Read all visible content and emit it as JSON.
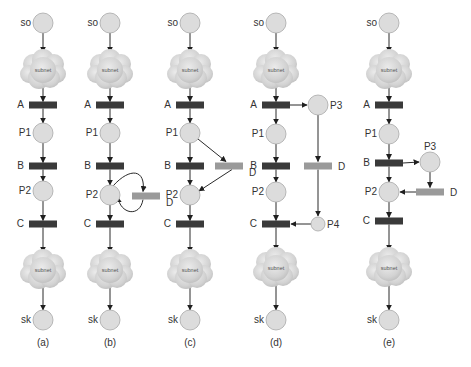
{
  "figure": {
    "colors": {
      "place_fill": "#dcdcdc",
      "place_stroke": "#a8a8a8",
      "transition_dark": "#3a3a3a",
      "transition_light": "#9a9a9a",
      "cloud": "#d0d0d0",
      "arc": "#2a2a2a"
    },
    "panels": [
      {
        "id": "a",
        "caption": "(a)",
        "x": 43,
        "nodes": [
          {
            "id": "so",
            "type": "place",
            "label": "so",
            "y": 23
          },
          {
            "id": "subnet1",
            "type": "cloud",
            "label": "subnet",
            "y": 70
          },
          {
            "id": "A",
            "type": "transition",
            "label": "A",
            "y": 105
          },
          {
            "id": "P1",
            "type": "place",
            "label": "P1",
            "y": 133
          },
          {
            "id": "B",
            "type": "transition",
            "label": "B",
            "y": 166
          },
          {
            "id": "P2",
            "type": "place",
            "label": "P2",
            "y": 191
          },
          {
            "id": "C",
            "type": "transition",
            "label": "C",
            "y": 224
          },
          {
            "id": "subnet2",
            "type": "cloud",
            "label": "subnet",
            "y": 270
          },
          {
            "id": "sk",
            "type": "place",
            "label": "sk",
            "y": 320
          }
        ],
        "extra": []
      },
      {
        "id": "b",
        "caption": "(b)",
        "x": 110,
        "nodes": [
          {
            "id": "so",
            "type": "place",
            "label": "so",
            "y": 23
          },
          {
            "id": "subnet1",
            "type": "cloud",
            "label": "subnet",
            "y": 70
          },
          {
            "id": "A",
            "type": "transition",
            "label": "A",
            "y": 105
          },
          {
            "id": "P1",
            "type": "place",
            "label": "P1",
            "y": 133
          },
          {
            "id": "B",
            "type": "transition",
            "label": "B",
            "y": 166
          },
          {
            "id": "P2",
            "type": "place",
            "label": "P2",
            "y": 195
          },
          {
            "id": "C",
            "type": "transition",
            "label": "C",
            "y": 224
          },
          {
            "id": "subnet2",
            "type": "cloud",
            "label": "subnet",
            "y": 270
          },
          {
            "id": "sk",
            "type": "place",
            "label": "sk",
            "y": 320
          }
        ],
        "extra": [
          {
            "id": "D",
            "type": "transition-light",
            "label": "D",
            "x": 146,
            "y": 196
          }
        ]
      },
      {
        "id": "c",
        "caption": "(c)",
        "x": 190,
        "nodes": [
          {
            "id": "so",
            "type": "place",
            "label": "so",
            "y": 23
          },
          {
            "id": "subnet1",
            "type": "cloud",
            "label": "subnet",
            "y": 70
          },
          {
            "id": "A",
            "type": "transition",
            "label": "A",
            "y": 105
          },
          {
            "id": "P1",
            "type": "place",
            "label": "P1",
            "y": 133
          },
          {
            "id": "B",
            "type": "transition",
            "label": "B",
            "y": 166
          },
          {
            "id": "P2",
            "type": "place",
            "label": "P2",
            "y": 195
          },
          {
            "id": "C",
            "type": "transition",
            "label": "C",
            "y": 224
          },
          {
            "id": "subnet2",
            "type": "cloud",
            "label": "subnet",
            "y": 270
          },
          {
            "id": "sk",
            "type": "place",
            "label": "sk",
            "y": 320
          }
        ],
        "extra": [
          {
            "id": "D",
            "type": "transition-light",
            "label": "D",
            "x": 229,
            "y": 166
          }
        ]
      },
      {
        "id": "d",
        "caption": "(d)",
        "x": 276,
        "nodes": [
          {
            "id": "so",
            "type": "place",
            "label": "so",
            "y": 23
          },
          {
            "id": "subnet1",
            "type": "cloud",
            "label": "subnet",
            "y": 70
          },
          {
            "id": "A",
            "type": "transition",
            "label": "A",
            "y": 105
          },
          {
            "id": "P1",
            "type": "place",
            "label": "P1",
            "y": 134
          },
          {
            "id": "B",
            "type": "transition",
            "label": "B",
            "y": 166
          },
          {
            "id": "P2",
            "type": "place",
            "label": "P2",
            "y": 192
          },
          {
            "id": "C",
            "type": "transition",
            "label": "C",
            "y": 224
          },
          {
            "id": "subnet2",
            "type": "cloud",
            "label": "subnet",
            "y": 268
          },
          {
            "id": "sk",
            "type": "place",
            "label": "sk",
            "y": 320
          }
        ],
        "extra": [
          {
            "id": "P3",
            "type": "place",
            "label": "P3",
            "x": 318,
            "y": 105
          },
          {
            "id": "D",
            "type": "transition-light",
            "label": "D",
            "x": 318,
            "y": 166
          },
          {
            "id": "P4",
            "type": "place-small",
            "label": "P4",
            "x": 318,
            "y": 224
          }
        ]
      },
      {
        "id": "e",
        "caption": "(e)",
        "x": 389,
        "nodes": [
          {
            "id": "so",
            "type": "place",
            "label": "so",
            "y": 23
          },
          {
            "id": "subnet1",
            "type": "cloud",
            "label": "subnet",
            "y": 70
          },
          {
            "id": "A",
            "type": "transition",
            "label": "A",
            "y": 105
          },
          {
            "id": "P1",
            "type": "place",
            "label": "P1",
            "y": 134
          },
          {
            "id": "B",
            "type": "transition",
            "label": "B",
            "y": 163
          },
          {
            "id": "P2",
            "type": "place",
            "label": "P2",
            "y": 192
          },
          {
            "id": "C",
            "type": "transition",
            "label": "C",
            "y": 221
          },
          {
            "id": "subnet2",
            "type": "cloud",
            "label": "subnet",
            "y": 268
          },
          {
            "id": "sk",
            "type": "place",
            "label": "sk",
            "y": 320
          }
        ],
        "extra": [
          {
            "id": "P3",
            "type": "place",
            "label": "P3",
            "x": 430,
            "y": 162
          },
          {
            "id": "D",
            "type": "transition-light",
            "label": "D",
            "x": 430,
            "y": 192
          }
        ]
      }
    ]
  }
}
